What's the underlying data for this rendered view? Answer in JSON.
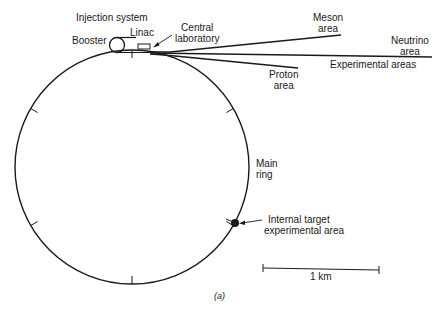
{
  "diagram": {
    "type": "accelerator-layout",
    "labels": {
      "injection_system": "Injection system",
      "booster": "Booster",
      "linac": "Linac",
      "central_laboratory": [
        "Central",
        "laboratory"
      ],
      "meson_area": [
        "Meson",
        "area"
      ],
      "neutrino_area": [
        "Neutrino",
        "area"
      ],
      "experimental_areas": "Experimental areas",
      "proton_area": [
        "Proton",
        "area"
      ],
      "main_ring": [
        "Main",
        "ring"
      ],
      "internal_target": [
        "Internal target",
        "experimental area"
      ],
      "scale_bar": "1 km",
      "caption": "(a)"
    },
    "components": [
      {
        "name": "Main ring",
        "shape": "circle"
      },
      {
        "name": "Booster",
        "shape": "small circle"
      },
      {
        "name": "Linac",
        "shape": "rectangle"
      },
      {
        "name": "Experimental areas",
        "shape": "beam lines",
        "branches": [
          "Meson area",
          "Neutrino area",
          "Proton area"
        ]
      },
      {
        "name": "Internal target experimental area",
        "shape": "dot on ring"
      }
    ],
    "ring_ticks": 6,
    "colors": {
      "line": "#1a1a1a",
      "background": "#ffffff"
    }
  }
}
